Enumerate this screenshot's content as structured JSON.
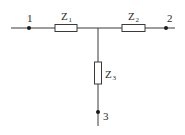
{
  "diagram": {
    "type": "T-network circuit",
    "colors": {
      "wire": "#3a3a3a",
      "node": "#1a1a1a",
      "text": "#2a2a2a",
      "background": "#ffffff"
    },
    "nodes": [
      {
        "id": "1",
        "label": "1"
      },
      {
        "id": "2",
        "label": "2"
      },
      {
        "id": "3",
        "label": "3"
      }
    ],
    "impedances": [
      {
        "id": "Z1",
        "base": "Z",
        "sub": "1",
        "between": [
          "1",
          "junction"
        ]
      },
      {
        "id": "Z2",
        "base": "Z",
        "sub": "2",
        "between": [
          "junction",
          "2"
        ]
      },
      {
        "id": "Z3",
        "base": "Z",
        "sub": "3",
        "between": [
          "junction",
          "3"
        ]
      }
    ]
  }
}
